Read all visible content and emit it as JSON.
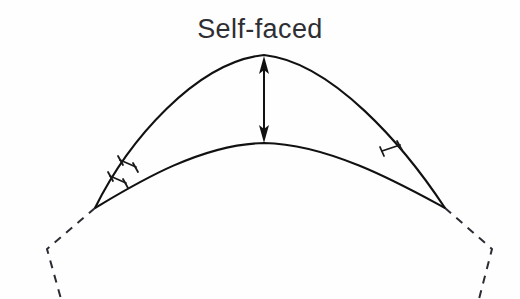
{
  "figure": {
    "title": "Self-faced",
    "background_color": "#fefefe",
    "line_color": "#111111",
    "dashed_color": "#2b2b33",
    "text_color": "#2e2e33",
    "width": 520,
    "height": 299
  },
  "labels": {
    "self_faced": "Self-faced"
  },
  "annotations": {
    "arrow": {
      "name": "rise-dimension-arrow",
      "style": "double-headed-vertical",
      "x": 264,
      "top_y": 57,
      "bottom_y": 142
    },
    "tick_marks": {
      "left_count": 2,
      "right_count": 1,
      "meaning": "equal-length congruence ticks"
    }
  },
  "geometry": {
    "outer_arc": {
      "name": "outer-arc",
      "left_point": [
        95,
        208
      ],
      "apex": [
        264,
        55
      ],
      "right_point": [
        445,
        208
      ]
    },
    "inner_arc": {
      "name": "inner-arc",
      "left_point": [
        95,
        208
      ],
      "apex": [
        264,
        143
      ],
      "right_point": [
        445,
        208
      ]
    },
    "left_dashed": {
      "name": "left-dashed-edge",
      "points": [
        [
          95,
          208
        ],
        [
          47,
          249
        ],
        [
          61,
          299
        ]
      ]
    },
    "right_dashed": {
      "name": "right-dashed-edge",
      "points": [
        [
          445,
          208
        ],
        [
          492,
          249
        ],
        [
          479,
          299
        ]
      ]
    }
  }
}
